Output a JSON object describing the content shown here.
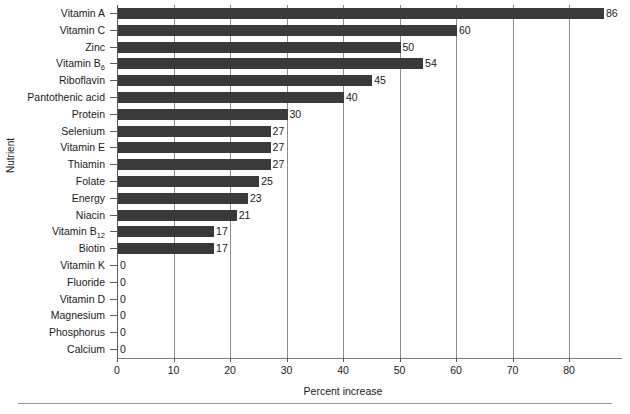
{
  "chart_data": {
    "type": "bar",
    "orientation": "horizontal",
    "title": "",
    "xlabel": "Percent increase",
    "ylabel": "Nutrient",
    "xlim": [
      0,
      89
    ],
    "xticks": [
      0,
      10,
      20,
      30,
      40,
      50,
      60,
      70,
      80
    ],
    "grid": "vertical",
    "legend": "none",
    "bar_color": "#3a3a3a",
    "categories": [
      "Vitamin A",
      "Vitamin C",
      "Zinc",
      "Vitamin B6",
      "Riboflavin",
      "Pantothenic acid",
      "Protein",
      "Selenium",
      "Vitamin E",
      "Thiamin",
      "Folate",
      "Energy",
      "Niacin",
      "Vitamin B12",
      "Biotin",
      "Vitamin K",
      "Fluoride",
      "Vitamin D",
      "Magnesium",
      "Phosphorus",
      "Calcium"
    ],
    "values": [
      86,
      60,
      50,
      54,
      45,
      40,
      30,
      27,
      27,
      27,
      25,
      23,
      21,
      17,
      17,
      0,
      0,
      0,
      0,
      0,
      0
    ],
    "data_labels": [
      "86",
      "60",
      "50",
      "54",
      "45",
      "40",
      "30",
      "27",
      "27",
      "27",
      "25",
      "23",
      "21",
      "17",
      "17",
      "0",
      "0",
      "0",
      "0",
      "0",
      "0"
    ],
    "category_html": [
      "Vitamin A",
      "Vitamin C",
      "Zinc",
      "Vitamin B<sub>6</sub>",
      "Riboflavin",
      "Pantothenic acid",
      "Protein",
      "Selenium",
      "Vitamin E",
      "Thiamin",
      "Folate",
      "Energy",
      "Niacin",
      "Vitamin B<sub>12</sub>",
      "Biotin",
      "Vitamin K",
      "Fluoride",
      "Vitamin D",
      "Magnesium",
      "Phosphorus",
      "Calcium"
    ]
  }
}
